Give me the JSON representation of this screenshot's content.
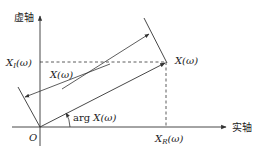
{
  "diagram": {
    "axes": {
      "imaginary_label": "虚轴",
      "real_label": "实轴",
      "origin_label": "O"
    },
    "labels": {
      "imag_component": "X",
      "imag_sub": "I",
      "imag_arg": "(ω)",
      "real_component": "X",
      "real_sub": "R",
      "real_arg": "(ω)",
      "point_label": "X(ω)",
      "vector_label": "X(ω)",
      "angle_prefix": "arg ",
      "angle_label": "X(ω)"
    },
    "colors": {
      "line": "#333333",
      "background": "#ffffff"
    }
  }
}
